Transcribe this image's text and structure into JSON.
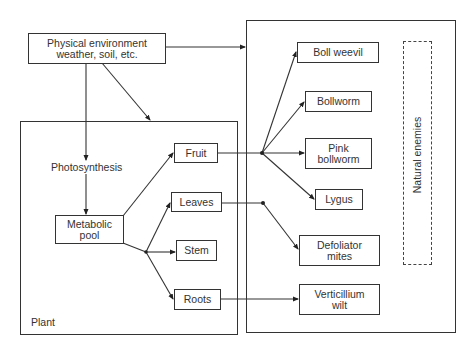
{
  "diagram": {
    "environment": {
      "line1": "Physical environment",
      "line2": "weather, soil, etc."
    },
    "plant": {
      "label": "Plant",
      "photosynthesis": "Photosynthesis",
      "metabolic_pool": {
        "line1": "Metabolic",
        "line2": "pool"
      },
      "parts": {
        "fruit": "Fruit",
        "leaves": "Leaves",
        "stem": "Stem",
        "roots": "Roots"
      }
    },
    "pests": {
      "boll_weevil": "Boll weevil",
      "bollworm": "Bollworm",
      "pink_bollworm": {
        "line1": "Pink",
        "line2": "bollworm"
      },
      "lygus": "Lygus",
      "defoliator_mites": {
        "line1": "Defoliator",
        "line2": "mites"
      },
      "verticillium_wilt": {
        "line1": "Verticillium",
        "line2": "wilt"
      }
    },
    "natural_enemies": "Natural enemies"
  }
}
